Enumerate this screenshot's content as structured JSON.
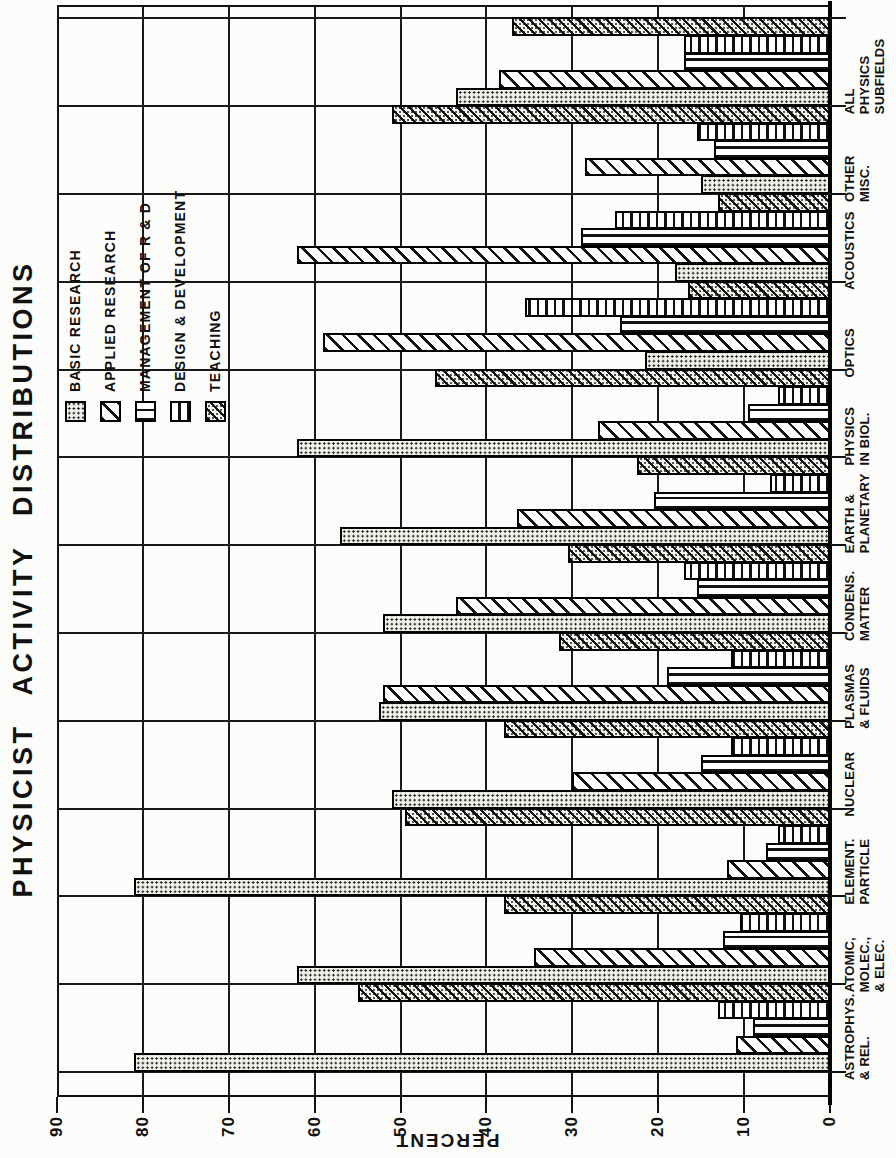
{
  "title": "PHYSICIST ACTIVITY DISTRIBUTIONS",
  "y_axis": {
    "label": "PERCENT",
    "ticks": [
      0,
      10,
      20,
      30,
      40,
      50,
      60,
      70,
      80,
      90
    ],
    "max": 90
  },
  "legend": [
    {
      "label": "BASIC RESEARCH",
      "pattern": "dots"
    },
    {
      "label": "APPLIED RESEARCH",
      "pattern": "diagonal"
    },
    {
      "label": "MANAGEMENT OF R & D",
      "pattern": "vertical-lines"
    },
    {
      "label": "DESIGN & DEVELOPMENT",
      "pattern": "horizontal-lines"
    },
    {
      "label": "TEACHING",
      "pattern": "diagonal-dense"
    }
  ],
  "chart_data": {
    "type": "bar",
    "title": "PHYSICIST ACTIVITY DISTRIBUTIONS",
    "ylabel": "PERCENT",
    "ylim": [
      0,
      90
    ],
    "grid": true,
    "legend_position": "upper-right-inside",
    "page_orientation": "chart rotated 90 degrees counter-clockwise on portrait page",
    "categories": [
      "ASTROPHYS. & REL.",
      "ATOMIC, MOLEC., & ELEC.",
      "ELEMENT. PARTICLE",
      "NUCLEAR",
      "PLASMAS & FLUIDS",
      "CONDENS. MATTER",
      "EARTH & PLANETARY",
      "PHYSICS IN BIOL.",
      "OPTICS",
      "ACOUSTICS",
      "OTHER MISC.",
      "ALL PHYSICS SUBFIELDS"
    ],
    "category_label_lines": [
      [
        "ASTROPHYS.",
        "& REL."
      ],
      [
        "ATOMIC,",
        "MOLEC.,",
        "& ELEC."
      ],
      [
        "ELEMENT.",
        "PARTICLE"
      ],
      [
        "NUCLEAR"
      ],
      [
        "PLASMAS",
        "& FLUIDS"
      ],
      [
        "CONDENS.",
        "MATTER"
      ],
      [
        "EARTH &",
        "PLANETARY"
      ],
      [
        "PHYSICS",
        "IN BIOL."
      ],
      [
        "OPTICS"
      ],
      [
        "ACOUSTICS"
      ],
      [
        "OTHER",
        "MISC."
      ],
      [
        "ALL",
        "PHYSICS",
        "SUBFIELDS"
      ]
    ],
    "series": [
      {
        "name": "BASIC RESEARCH",
        "pattern": "dots",
        "values": [
          81,
          62,
          81,
          51,
          52.5,
          52,
          57,
          62,
          21.5,
          18,
          15,
          43.5
        ]
      },
      {
        "name": "APPLIED RESEARCH",
        "pattern": "diagonal",
        "values": [
          11,
          34.5,
          12,
          30,
          52,
          43.5,
          36.5,
          27,
          59,
          62,
          28.5,
          38.5
        ]
      },
      {
        "name": "MANAGEMENT OF R & D",
        "pattern": "vertical-lines",
        "values": [
          9,
          12.5,
          7.5,
          15,
          19,
          15.5,
          20.5,
          9.5,
          24.5,
          29,
          13.5,
          17
        ]
      },
      {
        "name": "DESIGN & DEVELOPMENT",
        "pattern": "horizontal-lines",
        "values": [
          13,
          10.5,
          6,
          11.5,
          11.5,
          17,
          7,
          6,
          35.5,
          25,
          15.5,
          17
        ]
      },
      {
        "name": "TEACHING",
        "pattern": "diagonal-dense",
        "values": [
          55,
          38,
          49.5,
          38,
          31.5,
          30.5,
          22.5,
          46,
          16.5,
          13,
          51,
          37
        ]
      }
    ],
    "colors": {
      "ink": "#111111",
      "paper": "#fcfcfa"
    }
  }
}
